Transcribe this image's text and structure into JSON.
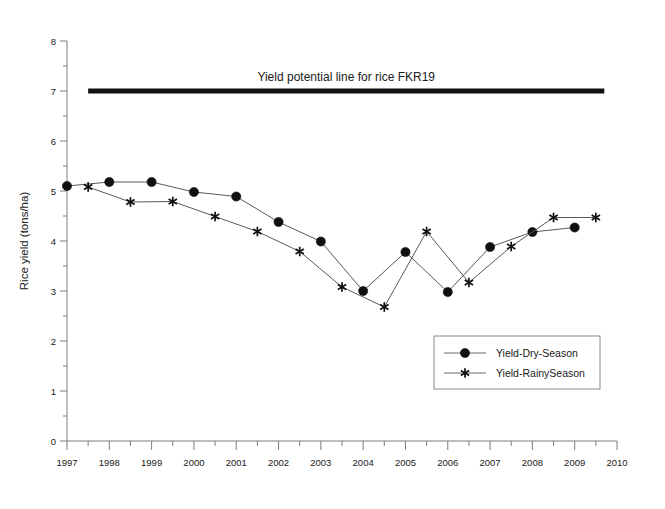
{
  "chart_data": {
    "type": "line",
    "title": "",
    "xlabel": "",
    "ylabel": "Rice yield (tons/ha)",
    "xlim": [
      1997,
      2010
    ],
    "ylim": [
      0,
      8
    ],
    "grid": false,
    "legend_position": "lower-right",
    "x_ticks": [
      "1997",
      "1998",
      "1999",
      "2000",
      "2001",
      "2002",
      "2003",
      "2004",
      "2005",
      "2006",
      "2007",
      "2008",
      "2009",
      "2010"
    ],
    "x_tick_values": [
      1997,
      1998,
      1999,
      2000,
      2001,
      2002,
      2003,
      2004,
      2005,
      2006,
      2007,
      2008,
      2009,
      2010
    ],
    "x_minor_ticks": [
      1997.5,
      1998.5,
      1999.5,
      2000.5,
      2001.5,
      2002.5,
      2003.5,
      2004.5,
      2005.5,
      2006.5,
      2007.5,
      2008.5,
      2009.5
    ],
    "y_ticks": [
      "0",
      "1",
      "2",
      "3",
      "4",
      "5",
      "6",
      "7",
      "8"
    ],
    "y_tick_values": [
      0,
      1,
      2,
      3,
      4,
      5,
      6,
      7,
      8
    ],
    "y_minor_ticks": [
      0.5,
      1.5,
      2.5,
      3.5,
      4.5,
      5.5,
      6.5,
      7.5
    ],
    "series": [
      {
        "name": "Yield-Dry-Season",
        "marker": "filled-circle",
        "color": "#101010",
        "x": [
          1997,
          1998,
          1999,
          2000,
          2001,
          2002,
          2003,
          2004,
          2005,
          2006,
          2007,
          2008,
          2009
        ],
        "values": [
          5.1,
          5.18,
          5.18,
          4.98,
          4.89,
          4.38,
          3.99,
          3.0,
          3.78,
          2.98,
          3.88,
          4.18,
          4.27
        ]
      },
      {
        "name": "Yield-RainySeason",
        "marker": "asterisk",
        "color": "#101010",
        "x": [
          1997.5,
          1998.5,
          1999.5,
          2000.5,
          2001.5,
          2002.5,
          2003.5,
          2004.5,
          2005.5,
          2006.5,
          2007.5,
          2008.5,
          2009.5
        ],
        "values": [
          5.08,
          4.78,
          4.79,
          4.49,
          4.19,
          3.79,
          3.08,
          2.68,
          4.19,
          3.17,
          3.89,
          4.47,
          4.47
        ]
      }
    ],
    "annotations": [
      {
        "kind": "horizontal-reference-line",
        "label": "Yield potential line for rice FKR19",
        "y_value": 7.0,
        "x_start": 1997.5,
        "x_end": 2009.7,
        "color": "#111111",
        "line_width": 5
      }
    ]
  },
  "legend": {
    "entries": [
      {
        "label": "Yield-Dry-Season",
        "marker": "filled-circle"
      },
      {
        "label": "Yield-RainySeason",
        "marker": "asterisk"
      }
    ]
  },
  "axis": {
    "y_title": "Rice yield (tons/ha)"
  }
}
